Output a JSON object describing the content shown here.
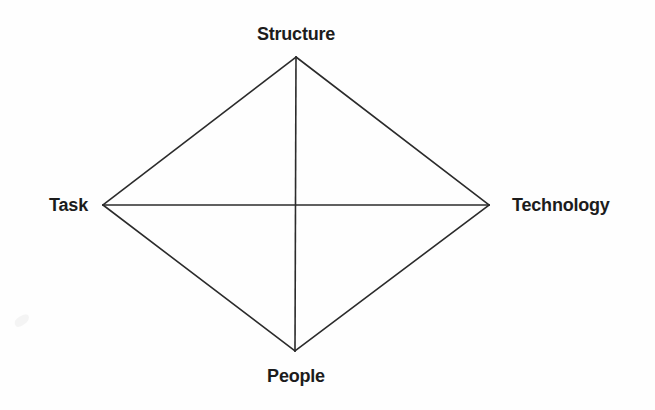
{
  "figure": {
    "background_color": "#fefefe",
    "line_color": "#2b2b2b",
    "text_color": "#1c1c1c",
    "line_width": 1.6,
    "width": 655,
    "height": 410
  },
  "labels": {
    "top": "Structure",
    "left": "Task",
    "right": "Technology",
    "bottom": "People"
  },
  "chart_data": {
    "type": "diagram",
    "nodes": [
      {
        "id": "structure",
        "label": "Structure",
        "position": "top",
        "x": 296,
        "y": 57
      },
      {
        "id": "task",
        "label": "Task",
        "position": "left",
        "x": 103,
        "y": 205
      },
      {
        "id": "technology",
        "label": "Technology",
        "position": "right",
        "x": 489,
        "y": 205
      },
      {
        "id": "people",
        "label": "People",
        "position": "bottom",
        "x": 295,
        "y": 351
      }
    ],
    "edges": [
      {
        "from": "structure",
        "to": "task",
        "style": "solid"
      },
      {
        "from": "structure",
        "to": "technology",
        "style": "solid"
      },
      {
        "from": "task",
        "to": "people",
        "style": "solid"
      },
      {
        "from": "technology",
        "to": "people",
        "style": "solid"
      },
      {
        "from": "structure",
        "to": "people",
        "style": "solid"
      },
      {
        "from": "task",
        "to": "technology",
        "style": "solid"
      }
    ],
    "shape": "diamond-with-diagonals",
    "legend": null,
    "grid": false
  }
}
